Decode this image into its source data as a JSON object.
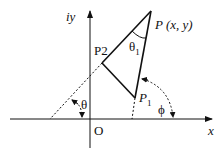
{
  "diagram": {
    "axis_labels": {
      "y": "iy",
      "x": "x",
      "origin": "O"
    },
    "points": {
      "P": "P (x, y)",
      "P1_main": "P",
      "P1_sub": "1",
      "P2": "P2"
    },
    "angles": {
      "theta1_main": "θ",
      "theta1_sub": "1",
      "theta": "θ",
      "phi": "ϕ"
    },
    "colors": {
      "stroke": "#111111",
      "background": "#ffffff"
    }
  }
}
